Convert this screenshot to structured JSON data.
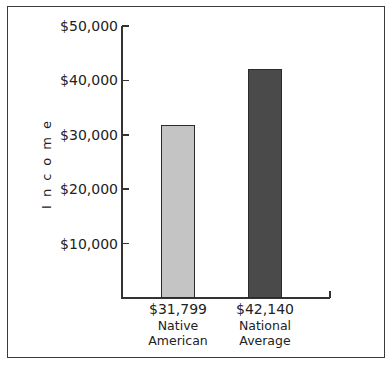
{
  "chart_data": {
    "type": "bar",
    "title": "",
    "xlabel": "",
    "ylabel": "Income",
    "categories": [
      "Native American",
      "National Average"
    ],
    "category_lines": [
      [
        "Native",
        "American"
      ],
      [
        "National",
        "Average"
      ]
    ],
    "values": [
      31799,
      42140
    ],
    "value_labels": [
      "$31,799",
      "$42,140"
    ],
    "bar_colors": [
      "#c4c4c4",
      "#4a4a4a"
    ],
    "ylim": [
      0,
      50000
    ],
    "yticks": [
      10000,
      20000,
      30000,
      40000,
      50000
    ],
    "ytick_labels": [
      "$10,000",
      "$20,000",
      "$30,000",
      "$40,000",
      "$50,000"
    ],
    "grid": false,
    "legend": null
  }
}
